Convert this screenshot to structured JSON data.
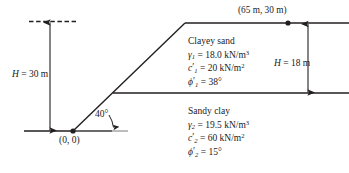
{
  "figure": {
    "type": "slope-stability-cross-section",
    "background_color": "#ffffff",
    "line_color": "#231f20"
  },
  "annotations": {
    "crest_coordinate_label": "(65 m, 30 m)",
    "origin_label": "(0, 0)",
    "slope_angle_label": "40°",
    "left_height_label": "H = 30 m",
    "right_height_label": "H = 18 m",
    "left_height_symbol": "H",
    "left_height_value": "30 m",
    "right_height_symbol": "H",
    "right_height_value": "18 m"
  },
  "layers": [
    {
      "name": "Clayey sand",
      "unit_weight": {
        "symbol": "γ",
        "subscript": "1",
        "value": "18.0",
        "unit": "kN/m",
        "unit_exponent": "3"
      },
      "cohesion": {
        "symbol": "c",
        "prime": "′",
        "subscript": "1",
        "value": "20",
        "unit": "kN/m",
        "unit_exponent": "2"
      },
      "friction_angle": {
        "symbol": "ϕ",
        "prime": "′",
        "subscript": "1",
        "value": "38",
        "unit": "°"
      }
    },
    {
      "name": "Sandy clay",
      "unit_weight": {
        "symbol": "γ",
        "subscript": "2",
        "value": "19.5",
        "unit": "kN/m",
        "unit_exponent": "3"
      },
      "cohesion": {
        "symbol": "c",
        "prime": "′",
        "subscript": "2",
        "value": "60",
        "unit": "kN/m",
        "unit_exponent": "2"
      },
      "friction_angle": {
        "symbol": "ϕ",
        "prime": "′",
        "subscript": "2",
        "value": "15",
        "unit": "°"
      }
    }
  ],
  "geometry_points": {
    "toe": "(0, 0)",
    "crest": "(65 m, 30 m)"
  }
}
